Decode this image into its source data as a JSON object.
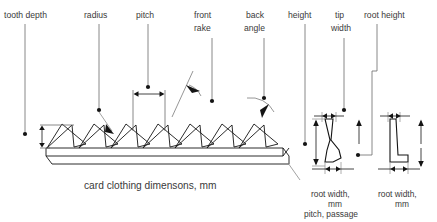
{
  "diagram": {
    "caption": "card clothing dimensons, mm",
    "units": "mm",
    "type": "engineering-dimension-diagram",
    "colors": {
      "background": "#ffffff",
      "line": "#1a1a1a",
      "leader": "#6b6b6b",
      "text": "#3a3a3a"
    },
    "top_labels": [
      {
        "id": "tooth-depth",
        "label": "tooth depth",
        "lines": [
          "tooth depth"
        ]
      },
      {
        "id": "radius",
        "label": "radius",
        "lines": [
          "radius"
        ]
      },
      {
        "id": "pitch",
        "label": "pitch",
        "lines": [
          "pitch"
        ]
      },
      {
        "id": "front-rake",
        "label": "front rake",
        "lines": [
          "front",
          "rake"
        ]
      },
      {
        "id": "back-angle",
        "label": "back angle",
        "lines": [
          "back",
          "angle"
        ]
      },
      {
        "id": "height",
        "label": "height",
        "lines": [
          "height"
        ]
      },
      {
        "id": "tip-width",
        "label": "tip width",
        "lines": [
          "tip",
          "width"
        ]
      },
      {
        "id": "root-height",
        "label": "root height",
        "lines": [
          "root height"
        ]
      }
    ],
    "profiles": [
      {
        "id": "profile-left",
        "shape": "knee-foot-tooth",
        "bottom_labels": [
          "root width,",
          "mm",
          "pitch, passage"
        ]
      },
      {
        "id": "profile-right",
        "shape": "wedge-tooth",
        "bottom_labels": [
          "root width,",
          "mm"
        ]
      }
    ],
    "saw_teeth": {
      "count": 7,
      "style": "perspective-wireframe"
    }
  }
}
